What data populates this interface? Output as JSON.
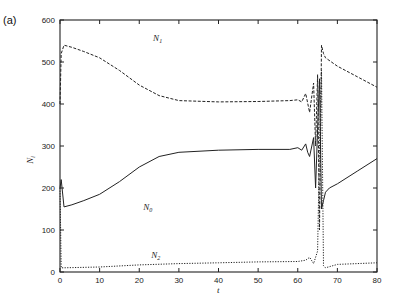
{
  "chart_data": {
    "type": "line",
    "panel_label": "(a)",
    "title": "",
    "xlabel": "t",
    "ylabel": "N_i",
    "xlim": [
      0,
      80
    ],
    "ylim": [
      0,
      600
    ],
    "xticks": [
      "0",
      "10",
      "20",
      "30",
      "40",
      "50",
      "60",
      "70",
      "80"
    ],
    "yticks": [
      "0",
      "100",
      "200",
      "300",
      "400",
      "500",
      "600"
    ],
    "grid": false,
    "legend": "inline curve labels",
    "series": [
      {
        "name": "N0",
        "label_main": "N",
        "label_sub": "0",
        "style": "solid",
        "x": [
          0,
          0.3,
          1,
          3,
          6,
          10,
          15,
          20,
          25,
          30,
          40,
          50,
          58,
          60,
          61,
          62,
          62.5,
          63,
          64,
          64.5,
          65,
          65.5,
          66,
          66.5,
          67,
          68,
          70,
          75,
          80
        ],
        "y": [
          200,
          220,
          155,
          160,
          170,
          185,
          215,
          250,
          275,
          285,
          290,
          292,
          292,
          296,
          290,
          305,
          285,
          275,
          320,
          200,
          340,
          460,
          150,
          170,
          190,
          200,
          210,
          240,
          270
        ]
      },
      {
        "name": "N1",
        "label_main": "N",
        "label_sub": "1",
        "style": "dashed",
        "x": [
          0,
          0.3,
          1,
          3,
          6,
          10,
          15,
          20,
          25,
          30,
          40,
          50,
          58,
          60,
          61,
          62,
          63,
          64,
          64.5,
          65,
          65.5,
          66,
          66.5,
          67,
          70,
          75,
          80
        ],
        "y": [
          400,
          520,
          540,
          535,
          525,
          510,
          480,
          445,
          420,
          408,
          405,
          406,
          408,
          410,
          405,
          425,
          380,
          450,
          300,
          470,
          100,
          540,
          520,
          510,
          490,
          465,
          440
        ]
      },
      {
        "name": "N2",
        "label_main": "N",
        "label_sub": "2",
        "style": "dotted",
        "x": [
          0,
          0.3,
          1,
          10,
          20,
          30,
          40,
          50,
          60,
          62,
          63,
          64,
          65,
          65.5,
          66,
          66.5,
          67,
          70,
          75,
          80
        ],
        "y": [
          200,
          10,
          10,
          12,
          17,
          20,
          22,
          24,
          25,
          28,
          35,
          20,
          50,
          300,
          480,
          15,
          10,
          18,
          20,
          22
        ]
      }
    ],
    "annotations": [
      {
        "text": "N1",
        "x": 23.5,
        "y": 550
      },
      {
        "text": "N0",
        "x": 21,
        "y": 148
      },
      {
        "text": "N2",
        "x": 23,
        "y": 34
      }
    ]
  }
}
